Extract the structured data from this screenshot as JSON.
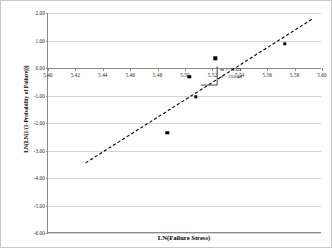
{
  "chart_data": {
    "type": "scatter",
    "title": "",
    "xlabel": "LN(Failure Stress)",
    "ylabel": "LN(LN(1/(1-Probability of Failure)))",
    "xlim": [
      5.4,
      5.6
    ],
    "ylim": [
      -6.0,
      2.0
    ],
    "xticks": [
      "5.40",
      "5.42",
      "5.44",
      "5.46",
      "5.48",
      "5.50",
      "5.52",
      "5.54",
      "5.56",
      "5.58",
      "5.60"
    ],
    "xtick_values": [
      5.4,
      5.42,
      5.44,
      5.46,
      5.48,
      5.5,
      5.52,
      5.54,
      5.56,
      5.58,
      5.6
    ],
    "yticks": [
      "2.00",
      "1.00",
      "0.00",
      "-1.00",
      "-2.00",
      "-3.00",
      "-4.00",
      "-5.00",
      "-6.00"
    ],
    "ytick_values": [
      2.0,
      1.0,
      0.0,
      -1.0,
      -2.0,
      -3.0,
      -4.0,
      -5.0,
      -6.0
    ],
    "grid": true,
    "grid_axis": "y",
    "legend": "none",
    "series": [
      {
        "name": "Failure data",
        "marker": "square",
        "color": "#000000",
        "points": [
          {
            "x": 5.487,
            "y": -2.35
          },
          {
            "x": 5.503,
            "y": -0.33
          },
          {
            "x": 5.508,
            "y": -1.05
          },
          {
            "x": 5.522,
            "y": 0.35
          },
          {
            "x": 5.573,
            "y": 0.87
          }
        ]
      }
    ],
    "trendline": {
      "style": "dashed",
      "color": "#000000",
      "x_start": 5.4275,
      "y_start": -3.45,
      "x_end": 5.5935,
      "y_end": 1.8
    },
    "slope_triangle": {
      "x_left": 5.5115,
      "x_right": 5.5235,
      "y_bottom": -0.62,
      "y_top": 0.06
    },
    "annotations": [
      {
        "label": "m = 31.60"
      },
      {
        "label": "σ = 252.48"
      }
    ]
  }
}
